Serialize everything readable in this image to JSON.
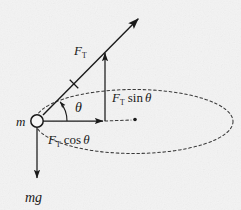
{
  "figure": {
    "background_color": "#f4f4f4",
    "ink_color": "#1a1a1a"
  },
  "labels": {
    "mass": "m",
    "tension": "F",
    "tension_sub": "T",
    "tension_vertical": "F",
    "tension_vertical_sub": "T",
    "tension_vertical_rest": " sin",
    "theta": "θ",
    "tension_horizontal": "F",
    "tension_horizontal_sub": "T",
    "tension_horizontal_rest": " cos",
    "weight": "mg",
    "angle_symbol": "θ"
  },
  "geometry": {
    "mass_circle": {
      "cx": 37,
      "cy": 121,
      "r": 6.2
    },
    "tension_arrow": {
      "x1": 43,
      "y1": 115,
      "x2": 140,
      "y2": 17
    },
    "tension_tick": {
      "cx": 74,
      "cy": 84
    },
    "vertical_arrow": {
      "x": 105,
      "y1": 121,
      "y2": 51
    },
    "horizontal_arrow": {
      "x1": 43,
      "y1": 121,
      "x2": 105,
      "y2": 121
    },
    "weight_arrow": {
      "x": 37,
      "y1": 128,
      "y2": 181
    },
    "ellipse": {
      "cx": 134,
      "cy": 121.5,
      "rx": 99,
      "ry": 32
    },
    "center_dot": {
      "cx": 135,
      "cy": 119.5,
      "r": 1.8
    },
    "angle_arc_radius": 30,
    "angle_degrees": 45
  },
  "label_positions": {
    "mass": {
      "x": 16,
      "y": 126
    },
    "tension": {
      "x": 75,
      "y": 54
    },
    "tension_vertical": {
      "x": 112,
      "y": 101
    },
    "theta": {
      "x": 75,
      "y": 111
    },
    "tension_horizontal": {
      "x": 49,
      "y": 143
    },
    "weight": {
      "x": 26,
      "y": 201
    }
  }
}
